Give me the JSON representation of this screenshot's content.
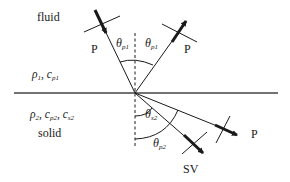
{
  "diagram": {
    "media": {
      "upper": {
        "name": "fluid",
        "properties": [
          {
            "symbol": "ρ",
            "sub": "1"
          },
          {
            "symbol": "c",
            "sub": "p1"
          }
        ]
      },
      "lower": {
        "name": "solid",
        "properties": [
          {
            "symbol": "ρ",
            "sub": "2"
          },
          {
            "symbol": "c",
            "sub": "p2"
          },
          {
            "symbol": "c",
            "sub": "s2"
          }
        ]
      }
    },
    "waves": {
      "incident": {
        "label": "P"
      },
      "reflected": {
        "label": "P"
      },
      "transmitted_p": {
        "label": "P"
      },
      "transmitted_sv": {
        "label": "SV"
      }
    },
    "angles": {
      "incident": {
        "symbol": "θ",
        "sub": "p1"
      },
      "reflected": {
        "symbol": "θ",
        "sub": "p1"
      },
      "transmitted_s": {
        "symbol": "θ",
        "sub": "s2"
      },
      "transmitted_p": {
        "symbol": "θ",
        "sub": "p2"
      }
    },
    "colors": {
      "line": "#1a1a1a",
      "interface": "#444444",
      "background": "#ffffff"
    }
  }
}
